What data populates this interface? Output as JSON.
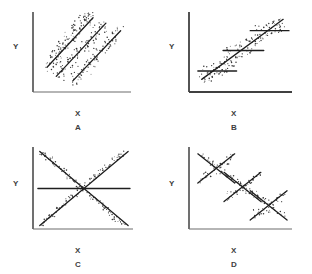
{
  "figure": {
    "background_color": "#ffffff",
    "ink_color": "#2b2b2b",
    "axis_color": "#555555",
    "point_color": "#333333",
    "line_color": "#1a1a1a"
  },
  "panels": [
    {
      "id": "A",
      "letter": "A",
      "x_label": "X",
      "y_label": "Y",
      "description": "Three parallel positively sloped regression lines with point clouds; groups offset along the x-axis"
    },
    {
      "id": "B",
      "letter": "B",
      "x_label": "X",
      "y_label": "Y",
      "description": "One overall positively sloped line with three flat horizontal within-group lines crossing it"
    },
    {
      "id": "C",
      "letter": "C",
      "x_label": "X",
      "y_label": "Y",
      "description": "One positively sloped and one negatively sloped line crossing in the centre plus a flat horizontal line"
    },
    {
      "id": "D",
      "letter": "D",
      "x_label": "X",
      "y_label": "Y",
      "description": "Three X-shaped crossings of positive and negative lines arranged along a descending diagonal"
    }
  ],
  "chart_data": [
    {
      "type": "scatter",
      "panel": "A",
      "title": "",
      "xlabel": "X",
      "ylabel": "Y",
      "xlim": [
        0,
        100
      ],
      "ylim": [
        0,
        100
      ],
      "grid": false,
      "legend": "none",
      "axes": {
        "x_axis": true,
        "y_axis": true,
        "ticks": false,
        "tick_labels": false
      },
      "series": [
        {
          "name": "group-1",
          "fit_line": {
            "x": [
              12,
              62
            ],
            "y": [
              30,
              95
            ],
            "slope": 1.3,
            "intercept": 14.4
          },
          "points_x": [
            13,
            16,
            18,
            20,
            22,
            24,
            26,
            28,
            30,
            32,
            34,
            36,
            38,
            40,
            42,
            44,
            46,
            48,
            50,
            52,
            54,
            56,
            58,
            60,
            15,
            19,
            23,
            27,
            31,
            35,
            39,
            43,
            47,
            51,
            55,
            59
          ],
          "points_y": [
            34,
            31,
            41,
            38,
            48,
            45,
            55,
            52,
            62,
            58,
            68,
            65,
            75,
            71,
            81,
            78,
            88,
            84,
            94,
            90,
            97,
            93,
            99,
            96,
            28,
            44,
            50,
            61,
            56,
            73,
            67,
            84,
            79,
            95,
            88,
            99
          ]
        },
        {
          "name": "group-2",
          "fit_line": {
            "x": [
              22,
              76
            ],
            "y": [
              18,
              88
            ],
            "slope": 1.3,
            "intercept": -10.5
          },
          "points_x": [
            23,
            26,
            29,
            32,
            35,
            38,
            41,
            44,
            47,
            50,
            53,
            56,
            59,
            62,
            65,
            68,
            71,
            74,
            25,
            30,
            36,
            42,
            48,
            54,
            60,
            66,
            72
          ],
          "points_y": [
            21,
            17,
            28,
            24,
            36,
            31,
            44,
            39,
            52,
            47,
            60,
            55,
            68,
            63,
            76,
            71,
            84,
            80,
            26,
            33,
            41,
            49,
            57,
            65,
            73,
            81,
            88
          ]
        },
        {
          "name": "group-3",
          "fit_line": {
            "x": [
              40,
              92
            ],
            "y": [
              12,
              78
            ],
            "slope": 1.27,
            "intercept": -38.8
          },
          "points_x": [
            41,
            44,
            47,
            50,
            53,
            56,
            59,
            62,
            65,
            68,
            71,
            74,
            77,
            80,
            83,
            86,
            89,
            43,
            49,
            55,
            61,
            67,
            73,
            79,
            85,
            91
          ],
          "points_y": [
            14,
            11,
            21,
            17,
            29,
            24,
            37,
            32,
            45,
            40,
            53,
            48,
            61,
            56,
            69,
            64,
            76,
            19,
            27,
            35,
            43,
            51,
            59,
            67,
            74,
            79
          ]
        }
      ]
    },
    {
      "type": "scatter",
      "panel": "B",
      "title": "",
      "xlabel": "X",
      "ylabel": "Y",
      "xlim": [
        0,
        100
      ],
      "ylim": [
        0,
        100
      ],
      "grid": false,
      "legend": "none",
      "axes": {
        "x_axis": true,
        "y_axis": true,
        "ticks": false,
        "tick_labels": false
      },
      "overall_line": {
        "x": [
          10,
          94
        ],
        "y": [
          14,
          93
        ],
        "slope": 0.94,
        "intercept": 4.6
      },
      "series": [
        {
          "name": "group-low",
          "fit_line": {
            "x": [
              6,
              46
            ],
            "y": [
              25,
              25
            ],
            "slope": 0,
            "intercept": 25
          },
          "points_x": [
            10,
            13,
            16,
            19,
            22,
            25,
            28,
            31,
            34,
            37,
            40,
            12,
            17,
            21,
            26,
            30,
            35,
            39
          ],
          "points_y": [
            16,
            22,
            12,
            27,
            18,
            31,
            23,
            35,
            26,
            38,
            30,
            29,
            14,
            33,
            20,
            37,
            24,
            33
          ]
        },
        {
          "name": "group-mid",
          "fit_line": {
            "x": [
              32,
              74
            ],
            "y": [
              52,
              52
            ],
            "slope": 0,
            "intercept": 52
          },
          "points_x": [
            36,
            39,
            42,
            45,
            48,
            51,
            54,
            57,
            60,
            63,
            66,
            38,
            43,
            47,
            52,
            56,
            61,
            65
          ],
          "points_y": [
            43,
            49,
            40,
            54,
            46,
            58,
            50,
            62,
            54,
            66,
            58,
            56,
            42,
            60,
            47,
            64,
            52,
            61
          ]
        },
        {
          "name": "group-high",
          "fit_line": {
            "x": [
              60,
              100
            ],
            "y": [
              78,
              78
            ],
            "slope": 0,
            "intercept": 78
          },
          "points_x": [
            64,
            67,
            70,
            73,
            76,
            79,
            82,
            85,
            88,
            91,
            94,
            66,
            71,
            75,
            80,
            84,
            89,
            93
          ],
          "points_y": [
            69,
            75,
            66,
            80,
            72,
            84,
            76,
            88,
            80,
            92,
            84,
            82,
            68,
            86,
            73,
            90,
            78,
            87
          ]
        }
      ]
    },
    {
      "type": "scatter",
      "panel": "C",
      "title": "",
      "xlabel": "X",
      "ylabel": "Y",
      "xlim": [
        0,
        100
      ],
      "ylim": [
        0,
        100
      ],
      "grid": false,
      "legend": "none",
      "axes": {
        "x_axis": true,
        "y_axis": true,
        "ticks": false,
        "tick_labels": false
      },
      "overall_line": {
        "x": [
          2,
          100
        ],
        "y": [
          50,
          50
        ],
        "slope": 0,
        "intercept": 50
      },
      "series": [
        {
          "name": "group-positive",
          "fit_line": {
            "x": [
              4,
              98
            ],
            "y": [
              2,
              98
            ],
            "slope": 1.02,
            "intercept": -2.1
          },
          "points_x": [
            6,
            12,
            18,
            24,
            30,
            36,
            42,
            48,
            54,
            60,
            66,
            72,
            78,
            84,
            90,
            9,
            15,
            21,
            27,
            33,
            39,
            45,
            51,
            57,
            63,
            69,
            75,
            81,
            87,
            93
          ],
          "points_y": [
            3,
            11,
            16,
            24,
            29,
            37,
            42,
            50,
            55,
            63,
            68,
            76,
            81,
            89,
            94,
            9,
            13,
            22,
            26,
            35,
            39,
            48,
            52,
            61,
            65,
            74,
            78,
            87,
            91,
            96
          ]
        },
        {
          "name": "group-negative",
          "fit_line": {
            "x": [
              4,
              98
            ],
            "y": [
              98,
              2
            ],
            "slope": -1.02,
            "intercept": 102.1
          },
          "points_x": [
            6,
            12,
            18,
            24,
            30,
            36,
            42,
            48,
            54,
            60,
            66,
            72,
            78,
            84,
            90,
            9,
            15,
            21,
            27,
            33,
            39,
            45,
            51,
            57,
            63,
            69,
            75,
            81,
            87,
            93
          ],
          "points_y": [
            96,
            90,
            85,
            77,
            72,
            64,
            59,
            51,
            46,
            38,
            33,
            25,
            20,
            12,
            7,
            93,
            88,
            80,
            75,
            67,
            62,
            54,
            49,
            41,
            36,
            28,
            23,
            15,
            10,
            5
          ]
        }
      ]
    },
    {
      "type": "scatter",
      "panel": "D",
      "title": "",
      "xlabel": "X",
      "ylabel": "Y",
      "xlim": [
        0,
        100
      ],
      "ylim": [
        0,
        100
      ],
      "grid": false,
      "legend": "none",
      "axes": {
        "x_axis": true,
        "y_axis": true,
        "ticks": false,
        "tick_labels": false
      },
      "clusters": [
        {
          "name": "cluster-upper-left",
          "center": [
            25,
            76
          ],
          "positive_line": {
            "x": [
              6,
              44
            ],
            "y": [
              57,
              95
            ],
            "slope": 1.0
          },
          "negative_line": {
            "x": [
              6,
              44
            ],
            "y": [
              95,
              57
            ],
            "slope": -1.0
          },
          "points_x": [
            9,
            13,
            17,
            21,
            25,
            29,
            33,
            37,
            41,
            11,
            15,
            19,
            23,
            27,
            31,
            35,
            39,
            12,
            20,
            28,
            36
          ],
          "points_y": [
            60,
            64,
            68,
            72,
            76,
            80,
            84,
            88,
            92,
            92,
            88,
            84,
            80,
            76,
            72,
            68,
            64,
            70,
            83,
            70,
            83
          ]
        },
        {
          "name": "cluster-middle",
          "center": [
            52,
            52
          ],
          "positive_line": {
            "x": [
              33,
              71
            ],
            "y": [
              33,
              71
            ],
            "slope": 1.0
          },
          "negative_line": {
            "x": [
              33,
              71
            ],
            "y": [
              71,
              33
            ],
            "slope": -1.0
          },
          "points_x": [
            36,
            40,
            44,
            48,
            52,
            56,
            60,
            64,
            68,
            38,
            42,
            46,
            50,
            54,
            58,
            62,
            66,
            39,
            47,
            55,
            63
          ],
          "points_y": [
            36,
            40,
            44,
            48,
            52,
            56,
            60,
            64,
            68,
            68,
            64,
            60,
            56,
            52,
            48,
            44,
            40,
            46,
            59,
            46,
            59
          ]
        },
        {
          "name": "cluster-lower-right",
          "center": [
            79,
            28
          ],
          "positive_line": {
            "x": [
              60,
              98
            ],
            "y": [
              9,
              47
            ],
            "slope": 1.0
          },
          "negative_line": {
            "x": [
              60,
              98
            ],
            "y": [
              47,
              9
            ],
            "slope": -1.0
          },
          "points_x": [
            63,
            67,
            71,
            75,
            79,
            83,
            87,
            91,
            95,
            65,
            69,
            73,
            77,
            81,
            85,
            89,
            93,
            66,
            74,
            82,
            90
          ],
          "points_y": [
            12,
            16,
            20,
            24,
            28,
            32,
            36,
            40,
            44,
            44,
            40,
            36,
            32,
            28,
            24,
            20,
            16,
            22,
            35,
            22,
            35
          ]
        }
      ]
    }
  ]
}
